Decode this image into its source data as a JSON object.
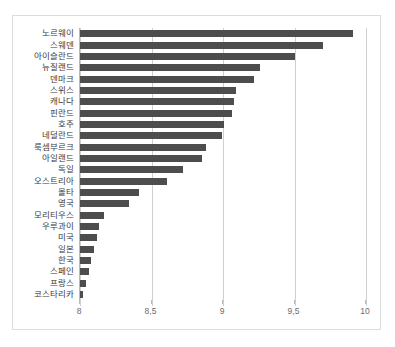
{
  "top_caption": "",
  "chart_data": {
    "type": "bar",
    "orientation": "horizontal",
    "title": "",
    "xlabel": "",
    "ylabel": "",
    "xlim": [
      8,
      10
    ],
    "grid": true,
    "legend": false,
    "bar_color": "#4d4d4d",
    "border_color": "#dcdcdc",
    "gridline_color": "#cfcfcf",
    "axis_color": "#b9b9b9",
    "tick_labels": [
      "8",
      "8,5",
      "9",
      "9,5",
      "10"
    ],
    "ticks": [
      8,
      8.5,
      9,
      9.5,
      10
    ],
    "categories": [
      "노르웨이",
      "스웨덴",
      "아이슬란드",
      "뉴질랜드",
      "덴마크",
      "스위스",
      "캐나다",
      "핀란드",
      "호주",
      "네덜란드",
      "룩셈부르크",
      "아일랜드",
      "독일",
      "오스트리아",
      "몰타",
      "영국",
      "모리티우스",
      "우루과이",
      "미국",
      "일본",
      "한국",
      "스페인",
      "프랑스",
      "코스타리카"
    ],
    "values": [
      9.91,
      9.7,
      9.5,
      9.26,
      9.22,
      9.09,
      9.08,
      9.06,
      9.01,
      8.99,
      8.88,
      8.85,
      8.72,
      8.61,
      8.41,
      8.34,
      8.17,
      8.13,
      8.12,
      8.1,
      8.08,
      8.06,
      8.04,
      8.02
    ]
  }
}
